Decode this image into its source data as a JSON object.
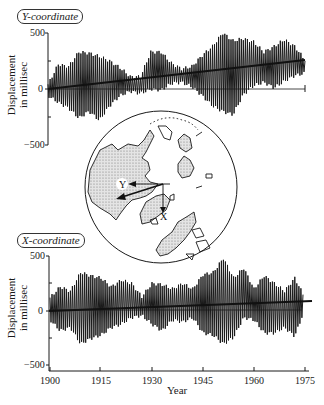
{
  "chart_data": [
    {
      "type": "line",
      "title": "Y-coordinate",
      "xlabel": "",
      "ylabel": "Displacement in millisec",
      "xlim": [
        1900,
        1975
      ],
      "ylim": [
        -500,
        500
      ],
      "yticks": [
        500,
        0,
        -500
      ],
      "ytick_labels": [
        "500",
        "0",
        "-500"
      ],
      "series": [
        {
          "name": "Y-coordinate oscillation",
          "description": "Chandler wobble oscillation, ~6-year beat envelope, amplitude ~100-330 ms",
          "x": [
            1900,
            1903,
            1906,
            1909,
            1912,
            1915,
            1918,
            1921,
            1924,
            1927,
            1930,
            1933,
            1936,
            1939,
            1942,
            1945,
            1948,
            1951,
            1954,
            1957,
            1960,
            1963,
            1966,
            1969,
            1972,
            1975
          ],
          "envelope_max": [
            40,
            220,
            200,
            330,
            320,
            290,
            250,
            190,
            110,
            110,
            330,
            330,
            230,
            180,
            200,
            300,
            380,
            500,
            430,
            450,
            420,
            330,
            380,
            440,
            380,
            260
          ],
          "envelope_min": [
            -60,
            -120,
            -170,
            -260,
            -200,
            -280,
            -150,
            -60,
            -20,
            -40,
            0,
            -10,
            50,
            60,
            20,
            -60,
            -150,
            -200,
            -230,
            -50,
            30,
            60,
            10,
            70,
            120,
            140
          ]
        },
        {
          "name": "Trend (secular drift)",
          "x": [
            1900,
            1975
          ],
          "values": [
            0,
            260
          ]
        }
      ]
    },
    {
      "type": "line",
      "title": "X-coordinate",
      "xlabel": "Year",
      "ylabel": "Displacement in millisec",
      "xlim": [
        1900,
        1975
      ],
      "ylim": [
        -500,
        500
      ],
      "xticks": [
        1900,
        1915,
        1930,
        1945,
        1960,
        1975
      ],
      "yticks": [
        500,
        0,
        -500
      ],
      "ytick_labels": [
        "500",
        "0",
        "-500"
      ],
      "series": [
        {
          "name": "X-coordinate oscillation",
          "description": "Chandler wobble oscillation, amplitude ~100-480 ms",
          "x": [
            1900,
            1903,
            1906,
            1909,
            1912,
            1915,
            1918,
            1921,
            1924,
            1927,
            1930,
            1933,
            1936,
            1939,
            1942,
            1945,
            1948,
            1951,
            1954,
            1957,
            1960,
            1963,
            1966,
            1969,
            1972,
            1975
          ],
          "envelope_max": [
            120,
            220,
            180,
            350,
            320,
            300,
            220,
            280,
            250,
            130,
            250,
            240,
            200,
            250,
            200,
            330,
            350,
            480,
            300,
            390,
            200,
            320,
            250,
            180,
            300,
            120
          ],
          "envelope_min": [
            -80,
            -180,
            -150,
            -300,
            -250,
            -220,
            -150,
            -120,
            -60,
            -40,
            -120,
            -180,
            -80,
            -100,
            -60,
            -200,
            -220,
            -300,
            -240,
            -60,
            -80,
            -200,
            -200,
            -150,
            -230,
            20
          ]
        },
        {
          "name": "Trend (secular drift)",
          "x": [
            1900,
            1975
          ],
          "values": [
            0,
            90
          ]
        }
      ]
    }
  ],
  "labels": {
    "top_title": "Y-coordinate",
    "bottom_title": "X-coordinate",
    "ylabel_line1": "Displacement",
    "ylabel_line2": "in millisec",
    "xlabel": "Year",
    "ytick_500": "500",
    "ytick_0": "0",
    "ytick_neg500": "−500",
    "xticks": [
      "1900",
      "1915",
      "1930",
      "1945",
      "1960",
      "1975"
    ],
    "map_arrow_y": "Y",
    "map_arrow_x": "X"
  },
  "map": {
    "description": "Polar projection map of Northern Hemisphere continents, centered on the North Pole, with X (down) and Y (left) coordinate axis arrows and pole drift vector arrow",
    "land_fill": "#d6d6d6"
  },
  "colors": {
    "line": "#1a1a1a",
    "background": "#ffffff"
  }
}
